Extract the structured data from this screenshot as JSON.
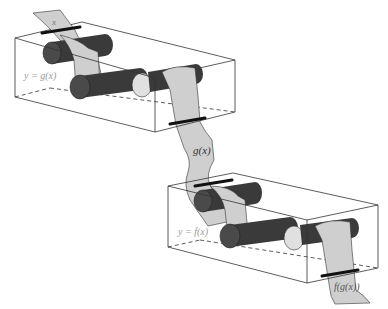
{
  "diagram": {
    "colors": {
      "strip": "#cfcfcf",
      "roller": "#3a3a3a",
      "roller_end": "#555555",
      "idler": "#e0e0e0",
      "box_edge": "#333333",
      "box_label": "#9a9a9a",
      "clamp": "#111111"
    },
    "machines": [
      {
        "name": "g-machine",
        "label": "y = g(x)"
      },
      {
        "name": "f-machine",
        "label": "y = f(x)"
      }
    ],
    "strips": {
      "input": "x",
      "intermediate": "g(x)",
      "output": "f(g(x))"
    }
  }
}
